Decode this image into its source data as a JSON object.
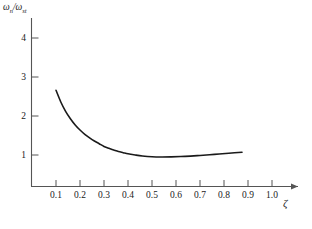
{
  "figure": {
    "background_color": "#ffffff",
    "curve_color": "#1a1a1a",
    "axis_color": "#555555"
  },
  "axes": {
    "y_label_numerator": "ω",
    "y_label_numerator_sub": "n",
    "y_label_separator": "/",
    "y_label_denominator": "ω",
    "y_label_denominator_sub": "st",
    "y_label_full": "ωn/ωst",
    "x_label": "ζ",
    "x_label_name": "zeta",
    "x_ticks": [
      "0.1",
      "0.2",
      "0.3",
      "0.4",
      "0.5",
      "0.6",
      "0.7",
      "0.8",
      "0.9",
      "1.0"
    ],
    "y_ticks": [
      "1",
      "2",
      "3",
      "4"
    ],
    "x_arrow": true
  },
  "chart_data": {
    "type": "line",
    "title": "",
    "subtitle": "",
    "xlabel": "ζ",
    "ylabel": "ωn/ωst",
    "xlim": [
      0.0,
      1.05
    ],
    "ylim": [
      0.0,
      4.55
    ],
    "x_tick_values": [
      0.1,
      0.2,
      0.3,
      0.4,
      0.5,
      0.6,
      0.7,
      0.8,
      0.9,
      1.0
    ],
    "y_tick_values": [
      1,
      2,
      3,
      4
    ],
    "grid": false,
    "legend": null,
    "legend_position": "none",
    "series": [
      {
        "name": "ωn/ωst vs ζ",
        "x": [
          0.1,
          0.12,
          0.14,
          0.16,
          0.18,
          0.2,
          0.22,
          0.24,
          0.26,
          0.28,
          0.3,
          0.32,
          0.34,
          0.36,
          0.38,
          0.4,
          0.43,
          0.46,
          0.5,
          0.54,
          0.58,
          0.62,
          0.66,
          0.7,
          0.74,
          0.78,
          0.82,
          0.875
        ],
        "y": [
          2.66,
          2.36,
          2.12,
          1.93,
          1.77,
          1.64,
          1.53,
          1.44,
          1.36,
          1.29,
          1.22,
          1.17,
          1.13,
          1.09,
          1.06,
          1.03,
          1.0,
          0.975,
          0.955,
          0.95,
          0.953,
          0.96,
          0.972,
          0.988,
          1.005,
          1.025,
          1.045,
          1.07
        ]
      }
    ],
    "annotations": [
      {
        "text": "curve minimum near ζ = 0.50",
        "x": 0.5,
        "y": 0.955
      }
    ]
  }
}
